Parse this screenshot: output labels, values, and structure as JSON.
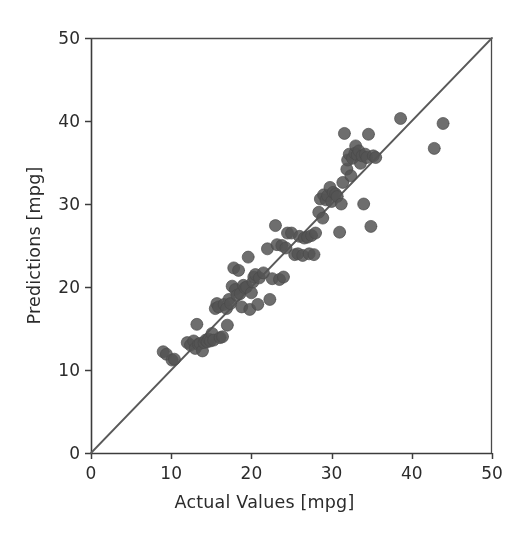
{
  "figure": {
    "width": 529,
    "height": 534,
    "background": "#ffffff"
  },
  "axis_titles": {
    "x": "Actual Values [mpg]",
    "y": "Predictions [mpg]"
  },
  "style": {
    "marker_color": "#555555",
    "marker_edge_color": "#4a4a4a",
    "marker_opacity": 0.85,
    "marker_diameter_px": 12,
    "line_color": "#5a5a5a",
    "spine_color": "#3c3c3c",
    "text_color": "#2b2b2b",
    "tick_color": "#3c3c3c"
  },
  "geometry": {
    "left_px": 91,
    "right_px": 492,
    "top_px": 38,
    "bottom_px": 453
  },
  "chart_data": {
    "type": "scatter",
    "title": "",
    "xlabel": "Actual Values [mpg]",
    "ylabel": "Predictions [mpg]",
    "xlim": [
      0,
      50
    ],
    "ylim": [
      0,
      50
    ],
    "xticks": [
      0,
      10,
      20,
      30,
      40,
      50
    ],
    "yticks": [
      0,
      10,
      20,
      30,
      40,
      50
    ],
    "xticklabels": [
      "0",
      "10",
      "20",
      "30",
      "40",
      "50"
    ],
    "yticklabels": [
      "0",
      "10",
      "20",
      "30",
      "40",
      "50"
    ],
    "grid": false,
    "legend": null,
    "reference_line": {
      "type": "identity",
      "x": [
        0,
        50
      ],
      "y": [
        0,
        50
      ],
      "color": "#5a5a5a",
      "width_px": 1.8
    },
    "series": [
      {
        "name": "Predictions vs Actual",
        "marker": "circle",
        "color": "#555555",
        "points": [
          [
            9.0,
            12.2
          ],
          [
            9.4,
            11.9
          ],
          [
            10.1,
            11.2
          ],
          [
            10.4,
            11.3
          ],
          [
            12.0,
            13.3
          ],
          [
            12.4,
            13.0
          ],
          [
            12.8,
            13.5
          ],
          [
            13.0,
            12.6
          ],
          [
            13.2,
            15.5
          ],
          [
            13.4,
            13.1
          ],
          [
            13.6,
            13.2
          ],
          [
            13.9,
            12.3
          ],
          [
            14.1,
            13.3
          ],
          [
            14.3,
            13.6
          ],
          [
            14.5,
            13.4
          ],
          [
            14.7,
            13.7
          ],
          [
            14.9,
            13.5
          ],
          [
            15.1,
            14.4
          ],
          [
            15.3,
            13.6
          ],
          [
            15.5,
            17.4
          ],
          [
            15.7,
            18.0
          ],
          [
            15.9,
            17.6
          ],
          [
            16.1,
            13.9
          ],
          [
            16.4,
            14.0
          ],
          [
            16.6,
            17.9
          ],
          [
            16.9,
            17.4
          ],
          [
            17.0,
            15.4
          ],
          [
            17.2,
            18.5
          ],
          [
            17.4,
            18.0
          ],
          [
            17.6,
            20.1
          ],
          [
            17.8,
            22.3
          ],
          [
            18.0,
            19.7
          ],
          [
            18.2,
            19.0
          ],
          [
            18.4,
            22.0
          ],
          [
            18.6,
            19.2
          ],
          [
            18.8,
            17.6
          ],
          [
            19.0,
            20.2
          ],
          [
            19.2,
            19.9
          ],
          [
            19.4,
            20.0
          ],
          [
            19.6,
            23.6
          ],
          [
            19.8,
            17.3
          ],
          [
            20.0,
            19.3
          ],
          [
            20.2,
            20.6
          ],
          [
            20.3,
            21.2
          ],
          [
            20.5,
            21.5
          ],
          [
            20.8,
            17.9
          ],
          [
            21.0,
            21.1
          ],
          [
            21.5,
            21.7
          ],
          [
            22.0,
            24.6
          ],
          [
            22.3,
            18.5
          ],
          [
            22.6,
            21.0
          ],
          [
            23.0,
            27.4
          ],
          [
            23.2,
            25.1
          ],
          [
            23.5,
            20.9
          ],
          [
            23.8,
            25.0
          ],
          [
            24.0,
            21.2
          ],
          [
            24.3,
            24.7
          ],
          [
            24.5,
            26.5
          ],
          [
            25.0,
            26.5
          ],
          [
            25.4,
            23.9
          ],
          [
            25.8,
            24.0
          ],
          [
            26.0,
            26.1
          ],
          [
            26.4,
            23.8
          ],
          [
            26.6,
            25.9
          ],
          [
            27.0,
            26.0
          ],
          [
            27.2,
            24.0
          ],
          [
            27.5,
            26.2
          ],
          [
            27.8,
            23.9
          ],
          [
            28.0,
            26.5
          ],
          [
            28.4,
            29.0
          ],
          [
            28.6,
            30.6
          ],
          [
            28.9,
            28.3
          ],
          [
            29.0,
            31.1
          ],
          [
            29.3,
            30.5
          ],
          [
            29.5,
            31.0
          ],
          [
            29.8,
            32.0
          ],
          [
            30.0,
            30.3
          ],
          [
            30.2,
            31.4
          ],
          [
            30.5,
            31.2
          ],
          [
            30.7,
            30.9
          ],
          [
            31.0,
            26.6
          ],
          [
            31.2,
            30.0
          ],
          [
            31.4,
            32.6
          ],
          [
            31.6,
            38.5
          ],
          [
            31.9,
            34.2
          ],
          [
            32.0,
            35.3
          ],
          [
            32.2,
            36.0
          ],
          [
            32.4,
            33.4
          ],
          [
            32.6,
            35.5
          ],
          [
            32.9,
            36.1
          ],
          [
            33.0,
            37.0
          ],
          [
            33.2,
            35.9
          ],
          [
            33.4,
            36.4
          ],
          [
            33.6,
            34.9
          ],
          [
            33.8,
            35.8
          ],
          [
            34.0,
            30.0
          ],
          [
            34.2,
            36.0
          ],
          [
            34.4,
            35.6
          ],
          [
            34.6,
            38.4
          ],
          [
            34.9,
            27.3
          ],
          [
            35.2,
            35.8
          ],
          [
            35.5,
            35.6
          ],
          [
            38.6,
            40.3
          ],
          [
            42.8,
            36.7
          ],
          [
            43.9,
            39.7
          ]
        ]
      }
    ]
  }
}
